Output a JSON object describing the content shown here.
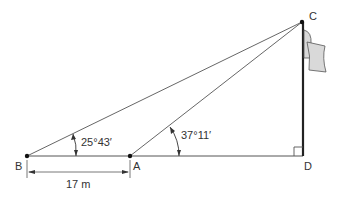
{
  "diagram": {
    "points": {
      "B": {
        "label": "B"
      },
      "A": {
        "label": "A"
      },
      "C": {
        "label": "C"
      },
      "D": {
        "label": "D"
      }
    },
    "angles": {
      "at_B": "25°43′",
      "at_A": "37°11′"
    },
    "distance_BA": "17 m",
    "right_angle_at": "D",
    "colors": {
      "line": "#555555",
      "pole": "#222222",
      "flag_fill": "#d9d9d9",
      "flag_stroke": "#555555"
    }
  }
}
